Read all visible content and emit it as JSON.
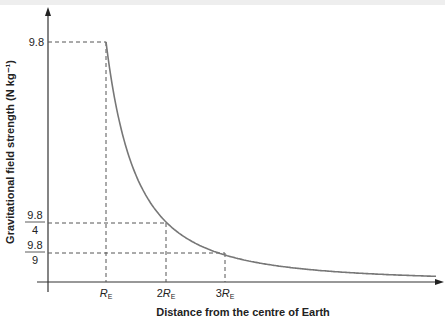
{
  "chart_data": {
    "type": "line",
    "title": "",
    "xlabel": "Distance from the centre of Earth",
    "ylabel": "Gravitational field strength (N kg⁻¹)",
    "x_ticks": [
      {
        "main": "R",
        "sub": "E",
        "prefix": ""
      },
      {
        "main": "R",
        "sub": "E",
        "prefix": "2"
      },
      {
        "main": "R",
        "sub": "E",
        "prefix": "3"
      }
    ],
    "y_ticks": [
      {
        "label": "9.8",
        "value": 9.8
      },
      {
        "num": "9.8",
        "den": "4",
        "value": 2.45
      },
      {
        "num": "9.8",
        "den": "9",
        "value": 1.089
      }
    ],
    "series": [
      {
        "name": "g = 9.8 (R_E/r)^2",
        "x_in_RE": [
          1,
          1.5,
          2,
          2.5,
          3,
          4,
          5,
          6
        ],
        "values": [
          9.8,
          4.36,
          2.45,
          1.57,
          1.09,
          0.61,
          0.39,
          0.27
        ]
      }
    ],
    "guides": "dashed lines from axes to points (R_E, 9.8), (2R_E, 9.8/4), (3R_E, 9.8/9)",
    "grid": false,
    "legend": "none"
  }
}
